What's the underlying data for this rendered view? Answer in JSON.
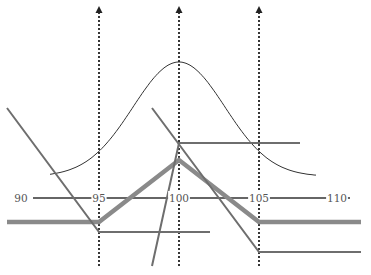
{
  "diagram": {
    "type": "option-payoff-diagram",
    "axis": {
      "y": 198,
      "x_start": 33,
      "x_end": 350,
      "color": "#333333",
      "ticks": [
        {
          "label": "90",
          "x": 21
        },
        {
          "label": "95",
          "x": 99
        },
        {
          "label": "100",
          "x": 179
        },
        {
          "label": "105",
          "x": 259
        },
        {
          "label": "110",
          "x": 337
        }
      ]
    },
    "strike_markers": [
      {
        "name": "strike-95",
        "x": 99,
        "y_top": 6,
        "y_bottom": 266
      },
      {
        "name": "strike-100",
        "x": 179,
        "y_top": 6,
        "y_bottom": 266
      },
      {
        "name": "strike-105",
        "x": 259,
        "y_top": 6,
        "y_bottom": 266
      }
    ],
    "distribution_curve": {
      "description": "bell-shaped probability density centered at 100",
      "center_x": 179,
      "peak_y": 62,
      "start": [
        50,
        154
      ],
      "end": [
        317,
        155
      ],
      "color": "#333333"
    },
    "payoff_lines": [
      {
        "name": "combined-butterfly-payoff",
        "style": "thick",
        "color": "#8a8a8a",
        "points": [
          [
            7,
            222
          ],
          [
            99,
            222
          ],
          [
            179,
            160
          ],
          [
            259,
            222
          ],
          [
            361,
            222
          ]
        ]
      },
      {
        "name": "long-put-95-payoff",
        "style": "thin",
        "color": "#6e6e6e",
        "points": [
          [
            7,
            108
          ],
          [
            99,
            232
          ],
          [
            210,
            232
          ]
        ]
      },
      {
        "name": "long-call-105-payoff",
        "style": "thin",
        "color": "#6e6e6e",
        "points": [
          [
            152,
            108
          ],
          [
            259,
            252
          ],
          [
            361,
            252
          ]
        ]
      },
      {
        "name": "short-straddle-100-leg",
        "style": "thin",
        "color": "#6e6e6e",
        "points": [
          [
            152,
            266
          ],
          [
            179,
            143
          ],
          [
            300,
            143
          ]
        ]
      }
    ]
  }
}
